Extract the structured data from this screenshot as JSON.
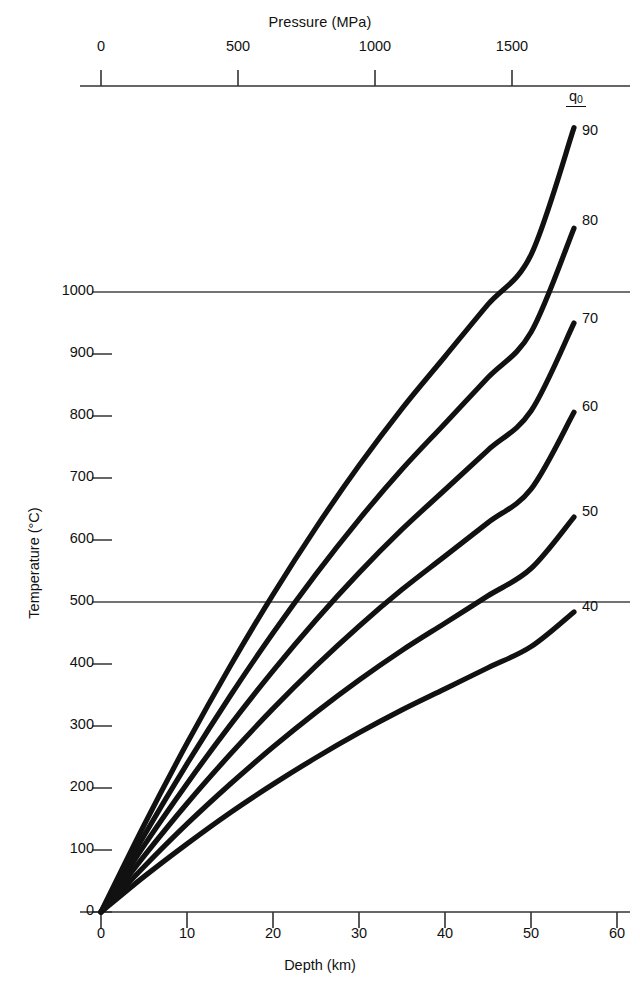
{
  "figure": {
    "top_axis": {
      "title": "Pressure (MPa)",
      "ticks": [
        0,
        500,
        1000,
        1500
      ],
      "tick_labels": [
        "0",
        "500",
        "1000",
        "1500"
      ],
      "range": [
        0,
        1650
      ],
      "units": "MPa"
    },
    "left_axis": {
      "title": "Temperature (°C)",
      "ticks": [
        0,
        100,
        200,
        300,
        400,
        500,
        600,
        700,
        800,
        900,
        1000
      ],
      "tick_labels": [
        "0",
        "100",
        "200",
        "300",
        "400",
        "500",
        "600",
        "700",
        "800",
        "900",
        "1000"
      ],
      "range": [
        0,
        1300
      ],
      "units": "°C"
    },
    "bottom_axis": {
      "title": "Depth (km)",
      "ticks": [
        0,
        10,
        20,
        30,
        40,
        50,
        60
      ],
      "tick_labels": [
        "0",
        "10",
        "20",
        "30",
        "40",
        "50",
        "60"
      ],
      "range": [
        0,
        60
      ],
      "units": "km"
    },
    "legend_header": {
      "symbol": "q",
      "subscript": "0"
    },
    "colors": {
      "curve": "#111111",
      "axis": "#444444",
      "gridline": "#555555",
      "background": "#ffffff"
    }
  },
  "chart_data": {
    "type": "line",
    "title": "",
    "xlabel": "Depth (km)",
    "ylabel": "Temperature (°C)",
    "xlim": [
      0,
      60
    ],
    "ylim": [
      0,
      1300
    ],
    "grid": "horizontal gridlines at 500 and 1000 °C only",
    "gridlines_y": [
      500,
      1000
    ],
    "secondary_xaxis": {
      "label": "Pressure (MPa)",
      "ticks": [
        0,
        500,
        1000,
        1500
      ],
      "position": "top"
    },
    "legend_position": "right end of each curve",
    "legend_title": "q0",
    "x": [
      0,
      5,
      10,
      15,
      20,
      25,
      30,
      35,
      40,
      45,
      50,
      55
    ],
    "series": [
      {
        "name": "90",
        "label": "90",
        "values": [
          0,
          140,
          272,
          396,
          512,
          620,
          720,
          812,
          896,
          980,
          1060,
          1265
        ]
      },
      {
        "name": "80",
        "label": "80",
        "values": [
          0,
          123,
          239,
          348,
          450,
          545,
          633,
          714,
          788,
          862,
          935,
          1103
        ]
      },
      {
        "name": "70",
        "label": "70",
        "values": [
          0,
          107,
          207,
          301,
          389,
          471,
          547,
          617,
          681,
          745,
          808,
          950
        ]
      },
      {
        "name": "60",
        "label": "60",
        "values": [
          0,
          90,
          175,
          254,
          328,
          397,
          461,
          520,
          574,
          628,
          682,
          806
        ]
      },
      {
        "name": "50",
        "label": "50",
        "values": [
          0,
          73,
          142,
          206,
          266,
          322,
          374,
          422,
          466,
          510,
          554,
          637
        ]
      },
      {
        "name": "40",
        "label": "40",
        "values": [
          0,
          57,
          110,
          160,
          206,
          249,
          289,
          326,
          360,
          394,
          428,
          484
        ]
      }
    ]
  }
}
